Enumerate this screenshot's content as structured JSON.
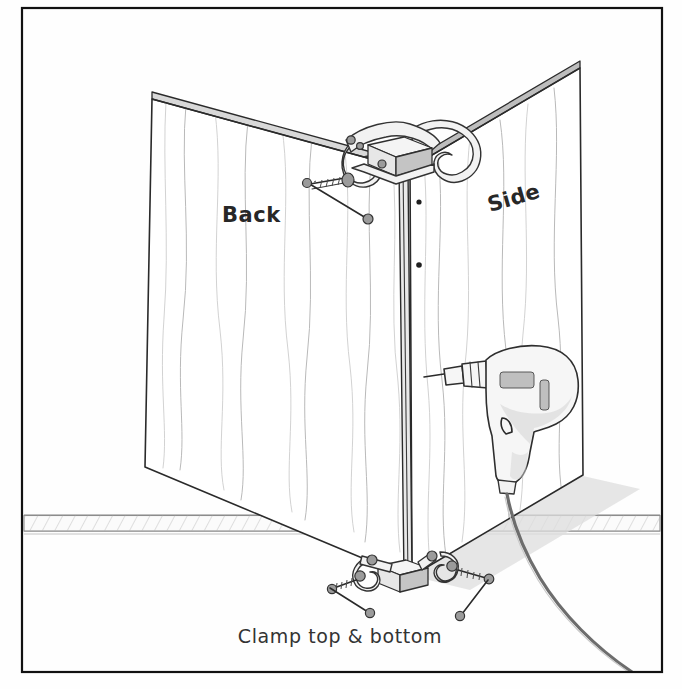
{
  "document": {
    "type": "hand-drawn woodworking assembly illustration",
    "subject": "Clamping a cabinet back panel to a side panel while drilling pilot holes",
    "background_color": "#fefefe",
    "ink_color": "#2a2a2a"
  },
  "frame": {
    "name": "page-border",
    "stroke_color": "#111111",
    "x": 22,
    "y": 8,
    "width": 640,
    "height": 664
  },
  "labels": {
    "back_panel": "Back",
    "side_panel": "Side",
    "caption": "Clamp top & bottom"
  },
  "objects": {
    "back_panel_name": "Back",
    "side_panel_name": "Side",
    "top_clamp_name": "C-clamp (top)",
    "bottom_clamp_left_name": "C-clamp (bottom left)",
    "bottom_clamp_right_name": "C-clamp (bottom right)",
    "spacer_block_name": "wood spacer block",
    "drill_name": "electric drill",
    "cord_name": "power cord",
    "floor_name": "floor and baseboard"
  },
  "colors": {
    "panel_fill": "#ffffff",
    "grain": "#b9b9b9",
    "edge_band": "#d8d8d8",
    "metal": "#f2f2f2",
    "drill_shade": "#d4d4d4",
    "cord": "#6d6d6d"
  },
  "geometry": {
    "back_panel_points": "152,99 404,168 410,578 145,467",
    "side_panel_points": "410,168 580,68 583,475 412,576",
    "corner_edge_top_x": 404,
    "corner_edge_bottom_x": 410,
    "pilot_holes": [
      {
        "cx": 418,
        "cy": 202
      },
      {
        "cx": 418,
        "cy": 265
      }
    ],
    "baseboard_top_y": 515,
    "baseboard_bottom_y": 531
  }
}
